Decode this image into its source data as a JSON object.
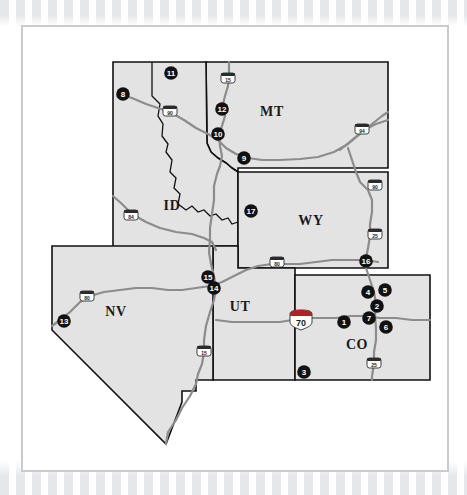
{
  "map": {
    "title": "Western States Reference Map",
    "colors": {
      "state_fill": "#e3e3e3",
      "state_border": "#111111",
      "highway": "#8c8c8c",
      "marker_fill": "#111111",
      "marker_text": "#ffffff",
      "frame": "#c9cbcd",
      "background": "#ffffff"
    },
    "states": [
      {
        "code": "MT",
        "name": "Montana",
        "label_x": 272,
        "label_y": 116
      },
      {
        "code": "ID",
        "name": "Idaho",
        "label_x": 172,
        "label_y": 210
      },
      {
        "code": "WY",
        "name": "Wyoming",
        "label_x": 311,
        "label_y": 225
      },
      {
        "code": "NV",
        "name": "Nevada",
        "label_x": 116,
        "label_y": 316
      },
      {
        "code": "UT",
        "name": "Utah",
        "label_x": 240,
        "label_y": 311
      },
      {
        "code": "CO",
        "name": "Colorado",
        "label_x": 357,
        "label_y": 349
      }
    ],
    "markers": [
      {
        "id": 1,
        "label": "1",
        "x": 344,
        "y": 322,
        "state": "CO"
      },
      {
        "id": 2,
        "label": "2",
        "x": 377,
        "y": 306,
        "state": "CO"
      },
      {
        "id": 3,
        "label": "3",
        "x": 304,
        "y": 372,
        "state": "CO"
      },
      {
        "id": 4,
        "label": "4",
        "x": 368,
        "y": 292,
        "state": "CO"
      },
      {
        "id": 5,
        "label": "5",
        "x": 385,
        "y": 290,
        "state": "CO"
      },
      {
        "id": 6,
        "label": "6",
        "x": 386,
        "y": 327,
        "state": "CO"
      },
      {
        "id": 7,
        "label": "7",
        "x": 369,
        "y": 318,
        "state": "CO"
      },
      {
        "id": 8,
        "label": "8",
        "x": 123,
        "y": 94,
        "state": "ID"
      },
      {
        "id": 9,
        "label": "9",
        "x": 244,
        "y": 158,
        "state": "MT"
      },
      {
        "id": 10,
        "label": "10",
        "x": 218,
        "y": 134,
        "state": "MT"
      },
      {
        "id": 11,
        "label": "11",
        "x": 171,
        "y": 73,
        "state": "MT"
      },
      {
        "id": 12,
        "label": "12",
        "x": 222,
        "y": 109,
        "state": "MT"
      },
      {
        "id": 13,
        "label": "13",
        "x": 64,
        "y": 321,
        "state": "NV"
      },
      {
        "id": 14,
        "label": "14",
        "x": 214,
        "y": 288,
        "state": "UT"
      },
      {
        "id": 15,
        "label": "15",
        "x": 208,
        "y": 277,
        "state": "UT"
      },
      {
        "id": 16,
        "label": "16",
        "x": 366,
        "y": 261,
        "state": "WY"
      },
      {
        "id": 17,
        "label": "17",
        "x": 251,
        "y": 211,
        "state": "WY"
      }
    ],
    "highway_shields": [
      {
        "number": "15",
        "x": 228,
        "y": 78,
        "type": "interstate",
        "state": "MT"
      },
      {
        "number": "90",
        "x": 170,
        "y": 111,
        "type": "interstate",
        "state": "MT"
      },
      {
        "number": "94",
        "x": 362,
        "y": 129,
        "type": "interstate",
        "state": "MT"
      },
      {
        "number": "84",
        "x": 131,
        "y": 215,
        "type": "interstate",
        "state": "ID"
      },
      {
        "number": "90",
        "x": 375,
        "y": 185,
        "type": "interstate",
        "state": "WY"
      },
      {
        "number": "25",
        "x": 375,
        "y": 234,
        "type": "interstate",
        "state": "WY"
      },
      {
        "number": "80",
        "x": 277,
        "y": 262,
        "type": "interstate",
        "state": "WY"
      },
      {
        "number": "80",
        "x": 87,
        "y": 296,
        "type": "interstate",
        "state": "NV"
      },
      {
        "number": "15",
        "x": 204,
        "y": 351,
        "type": "interstate",
        "state": "UT"
      },
      {
        "number": "25",
        "x": 374,
        "y": 363,
        "type": "interstate",
        "state": "CO"
      },
      {
        "number": "70",
        "x": 301,
        "y": 320,
        "type": "interstate-large",
        "state": "CO"
      }
    ]
  }
}
